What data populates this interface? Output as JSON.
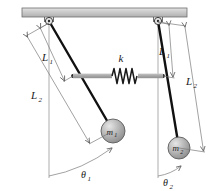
{
  "figure": {
    "colors": {
      "ceiling_fill": "#c9c9c9",
      "ceiling_stroke": "#6e6e6e",
      "rod_stroke": "#111111",
      "link_bar": "#a8a8a8",
      "dimension_line": "#7a7a7a",
      "mass_fill": "#b5b5b5",
      "mass_stroke": "#555555",
      "spring_stroke": "#1a1a1a",
      "text": "#1a1a1a"
    }
  },
  "labels": {
    "spring_constant": "k",
    "left": {
      "length_inner": "L",
      "length_inner_sub": "1",
      "length_outer": "L",
      "length_outer_sub": "2",
      "mass": "m",
      "mass_sub": "1",
      "angle": "θ",
      "angle_sub": "1"
    },
    "right": {
      "length_inner": "L",
      "length_inner_sub": "1",
      "length_outer": "L",
      "length_outer_sub": "2",
      "mass": "m",
      "mass_sub": "2",
      "angle": "θ",
      "angle_sub": "2"
    }
  },
  "geometry": {
    "ceiling": {
      "x": 22,
      "y": 8,
      "width": 165,
      "height": 9
    },
    "pivot_left": {
      "x": 49,
      "y": 21,
      "r": 3.6
    },
    "pivot_right": {
      "x": 158,
      "y": 21,
      "r": 3.6
    },
    "rod_left": {
      "x1": 49,
      "y1": 21,
      "x2": 113,
      "y2": 131
    },
    "rod_right": {
      "x1": 158,
      "y1": 21,
      "x2": 179,
      "y2": 148
    },
    "spring_attach_left": {
      "x": 73,
      "y": 76
    },
    "spring_attach_right": {
      "x": 163,
      "y": 76
    },
    "mass_left": {
      "cx": 113,
      "cy": 131,
      "r": 12
    },
    "mass_right": {
      "cx": 179,
      "cy": 148,
      "r": 11
    },
    "vertical_ref_left": {
      "x": 49,
      "y1": 21,
      "y2": 178
    },
    "vertical_ref_right": {
      "x": 158,
      "y1": 21,
      "y2": 178
    }
  }
}
